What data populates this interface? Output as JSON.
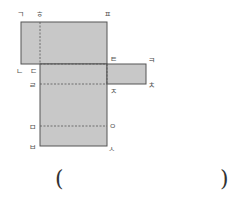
{
  "figure": {
    "fill_color": "#c8c8c8",
    "stroke_color": "#555555",
    "labels": {
      "g": "ㄱ",
      "h": "ㅎ",
      "p": "ㅍ",
      "t": "ㅌ",
      "k": "ㅋ",
      "n": "ㄴ",
      "d": "ㄷ",
      "r": "ㄹ",
      "j": "ㅈ",
      "ch": "ㅊ",
      "m": "ㅁ",
      "o": "ㅇ",
      "b": "ㅂ",
      "s": "ㅅ"
    }
  },
  "answer": {
    "open_paren": "(",
    "close_paren": ")",
    "value": ""
  }
}
